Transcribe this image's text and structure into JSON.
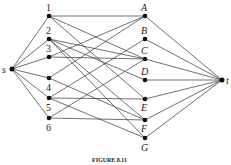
{
  "nodes": {
    "s": "s",
    "t": "t",
    "n1": "1",
    "n2": "2",
    "n3": "3",
    "n4": "4",
    "n5": "5",
    "n6": "6",
    "A": "A",
    "B": "B",
    "C": "C",
    "D": "D",
    "E": "E",
    "F": "F",
    "G": "G"
  },
  "caption": "FIGURE 8.11"
}
